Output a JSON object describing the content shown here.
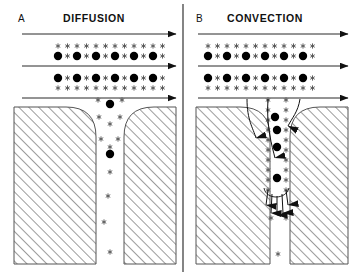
{
  "figure": {
    "type": "diagram",
    "background_color": "#ffffff",
    "line_color": "#111111",
    "hatch_color": "#555555",
    "particle_color": "#000000",
    "tracer_color": "#555555",
    "width": 352,
    "height": 278
  },
  "divider": {
    "name": "panel-divider",
    "x": 183,
    "y_top": 4,
    "y_bottom": 272,
    "color": "#333333"
  },
  "panels": [
    {
      "id": "A",
      "letter": "A",
      "title": "DIFFUSION",
      "letter_x": 18,
      "letter_y": 22,
      "title_x": 94,
      "title_y": 22,
      "flow_lines": [
        {
          "name": "flow-arrow-top",
          "y": 34,
          "x1": 22,
          "x2": 176
        },
        {
          "name": "flow-arrow-middle",
          "y": 66,
          "x1": 22,
          "x2": 176
        },
        {
          "name": "flow-arrow-bottom",
          "y": 98,
          "x1": 22,
          "x2": 176
        }
      ],
      "tracer_rows_y": [
        46,
        56,
        78,
        88
      ],
      "particle_rows_y": [
        56,
        78
      ],
      "column_x": [
        58,
        77,
        96,
        115,
        134,
        153
      ],
      "cavity": {
        "name": "cavity-A",
        "left_block": {
          "x": 14,
          "w": 82,
          "corner": "rounded-right"
        },
        "right_block": {
          "x": 124,
          "w": 52,
          "corner": "rounded-left"
        },
        "top_y": 107,
        "bottom_y": 264,
        "channel_left": 96,
        "channel_right": 124
      },
      "cavity_particles": [
        {
          "type": "particle",
          "x": 110,
          "y": 104
        },
        {
          "type": "particle",
          "x": 110,
          "y": 154
        }
      ],
      "cavity_tracers": [
        {
          "x": 98,
          "y": 100
        },
        {
          "x": 122,
          "y": 100
        },
        {
          "x": 99,
          "y": 117
        },
        {
          "x": 120,
          "y": 117
        },
        {
          "x": 110,
          "y": 124
        },
        {
          "x": 101,
          "y": 139
        },
        {
          "x": 118,
          "y": 139
        },
        {
          "x": 110,
          "y": 147
        },
        {
          "x": 110,
          "y": 172
        },
        {
          "x": 108,
          "y": 196
        },
        {
          "x": 104,
          "y": 222
        },
        {
          "x": 110,
          "y": 252
        }
      ],
      "curved_arrows": [],
      "fan_arrows": []
    },
    {
      "id": "B",
      "letter": "B",
      "title": "CONVECTION",
      "letter_x": 196,
      "letter_y": 22,
      "title_x": 265,
      "title_y": 22,
      "flow_lines": [
        {
          "name": "flow-arrow-top",
          "y": 34,
          "x1": 198,
          "x2": 348
        },
        {
          "name": "flow-arrow-middle",
          "y": 66,
          "x1": 198,
          "x2": 348
        },
        {
          "name": "flow-arrow-bottom",
          "y": 98,
          "x1": 198,
          "x2": 348
        }
      ],
      "tracer_rows_y": [
        46,
        56,
        78,
        88
      ],
      "particle_rows_y": [
        56,
        78
      ],
      "column_x": [
        208,
        227,
        246,
        265,
        284,
        303
      ],
      "cavity": {
        "name": "cavity-B",
        "left_block": {
          "x": 196,
          "w": 74,
          "corner": "rounded-right"
        },
        "right_block": {
          "x": 290,
          "w": 58,
          "corner": "rounded-left"
        },
        "top_y": 107,
        "bottom_y": 264,
        "channel_left": 270,
        "channel_right": 290
      },
      "cavity_particles": [
        {
          "type": "particle",
          "x": 275,
          "y": 117
        },
        {
          "type": "particle",
          "x": 277,
          "y": 147
        },
        {
          "type": "particle",
          "x": 277,
          "y": 178
        },
        {
          "type": "particle",
          "x": 277,
          "y": 130
        }
      ],
      "cavity_tracers": [
        {
          "x": 268,
          "y": 100
        },
        {
          "x": 286,
          "y": 100
        },
        {
          "x": 268,
          "y": 110
        },
        {
          "x": 286,
          "y": 110
        },
        {
          "x": 268,
          "y": 120
        },
        {
          "x": 286,
          "y": 120
        },
        {
          "x": 268,
          "y": 130
        },
        {
          "x": 286,
          "y": 130
        },
        {
          "x": 268,
          "y": 140
        },
        {
          "x": 286,
          "y": 140
        },
        {
          "x": 268,
          "y": 150
        },
        {
          "x": 286,
          "y": 150
        },
        {
          "x": 268,
          "y": 160
        },
        {
          "x": 286,
          "y": 160
        },
        {
          "x": 268,
          "y": 170
        },
        {
          "x": 286,
          "y": 170
        },
        {
          "x": 268,
          "y": 180
        },
        {
          "x": 286,
          "y": 180
        },
        {
          "x": 268,
          "y": 190
        },
        {
          "x": 286,
          "y": 190
        },
        {
          "x": 271,
          "y": 218
        },
        {
          "x": 286,
          "y": 218
        },
        {
          "x": 278,
          "y": 254
        }
      ],
      "curved_arrows": [
        {
          "name": "convection-arrow-left",
          "path": "M 247 99 C 247 120, 253 128, 256 138",
          "tip": [
            256,
            144
          ]
        },
        {
          "name": "convection-arrow-mid",
          "path": "M 268 99 C 266 126, 272 146, 275 158",
          "tip": [
            276,
            164
          ]
        },
        {
          "name": "convection-arrow-right",
          "path": "M 300 99 C 298 112, 292 118, 288 126",
          "tip": [
            287,
            132
          ]
        }
      ],
      "fan_arrows": {
        "name": "recirculation-fan",
        "arc": "M 264 188 C 266 200, 286 200, 289 188",
        "arrows": [
          {
            "x1": 268,
            "y1": 190,
            "x2": 266,
            "y2": 205
          },
          {
            "x1": 272,
            "y1": 194,
            "x2": 271,
            "y2": 213
          },
          {
            "x1": 277,
            "y1": 196,
            "x2": 277,
            "y2": 215
          },
          {
            "x1": 282,
            "y1": 194,
            "x2": 283,
            "y2": 213
          },
          {
            "x1": 286,
            "y1": 190,
            "x2": 288,
            "y2": 205
          }
        ]
      }
    }
  ],
  "legend_semantics": {
    "particle_label": "large solid circle = colloidal particle",
    "tracer_label": "small asterisk = solute / tracer molecule",
    "flow_label": "horizontal arrow = bulk flow direction",
    "curved_arrow_label": "curved arrow = convective transport into cavity"
  }
}
